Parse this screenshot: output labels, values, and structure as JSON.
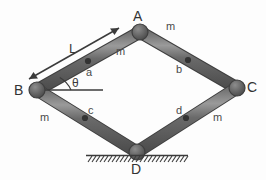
{
  "figure": {
    "type": "rhombus-four-bar-linkage-diagram",
    "background_color": "#fdfdfd",
    "bar_color": "#5e5e5e",
    "bar_highlight_color": "#8a8a8a",
    "bar_edge_color": "#3f3f3f",
    "joint_color": "#5e5e5e",
    "com_dot_color": "#3a3a3a",
    "annotation_color": "#3b3b3b"
  },
  "vertices": [
    {
      "id": "A",
      "label": "A",
      "x": 140,
      "y": 32,
      "label_x": 133,
      "label_y": 9
    },
    {
      "id": "B",
      "label": "B",
      "x": 37,
      "y": 90,
      "label_x": 14,
      "label_y": 83
    },
    {
      "id": "C",
      "label": "C",
      "x": 237,
      "y": 88,
      "label_x": 247,
      "label_y": 80
    },
    {
      "id": "D",
      "label": "D",
      "x": 137,
      "y": 152,
      "label_x": 131,
      "label_y": 162
    }
  ],
  "bars": [
    {
      "id": "a",
      "from": "B",
      "to": "A",
      "mass_label": "m",
      "com_label": "a",
      "mass_x": 116,
      "mass_y": 46,
      "com_x": 86,
      "com_y": 67,
      "com_dot_x": 88,
      "com_dot_y": 61
    },
    {
      "id": "b",
      "from": "A",
      "to": "C",
      "mass_label": "m",
      "com_label": "b",
      "mass_x": 166,
      "mass_y": 21,
      "com_x": 176,
      "com_y": 64,
      "com_dot_x": 188,
      "com_dot_y": 60
    },
    {
      "id": "c",
      "from": "B",
      "to": "D",
      "mass_label": "m",
      "com_label": "c",
      "mass_x": 40,
      "mass_y": 112,
      "com_x": 88,
      "com_y": 105,
      "com_dot_x": 85,
      "com_dot_y": 118
    },
    {
      "id": "d",
      "from": "D",
      "to": "C",
      "mass_label": "m",
      "com_label": "d",
      "mass_x": 213,
      "mass_y": 112,
      "com_x": 176,
      "com_y": 105,
      "com_dot_x": 186,
      "com_dot_y": 118
    }
  ],
  "annotations": {
    "length": {
      "label": "L",
      "label_x": 69,
      "label_y": 42,
      "arrow_from_x": 28,
      "arrow_from_y": 80,
      "arrow_to_x": 120,
      "arrow_to_y": 28,
      "double_headed": true
    },
    "angle": {
      "label": "θ",
      "label_x": 72,
      "label_y": 77,
      "arc_radius": 26,
      "from_deg": 0,
      "to_deg": 29,
      "reference_line_from_x": 44,
      "reference_line_from_y": 90,
      "reference_line_to_x": 102,
      "reference_line_to_y": 90
    },
    "ground": {
      "name": "fixed-support-hatching",
      "line_from_x": 86,
      "line_from_y": 155,
      "line_to_x": 188,
      "line_to_y": 155,
      "hatch_count": 26,
      "hatch_length": 7
    }
  }
}
